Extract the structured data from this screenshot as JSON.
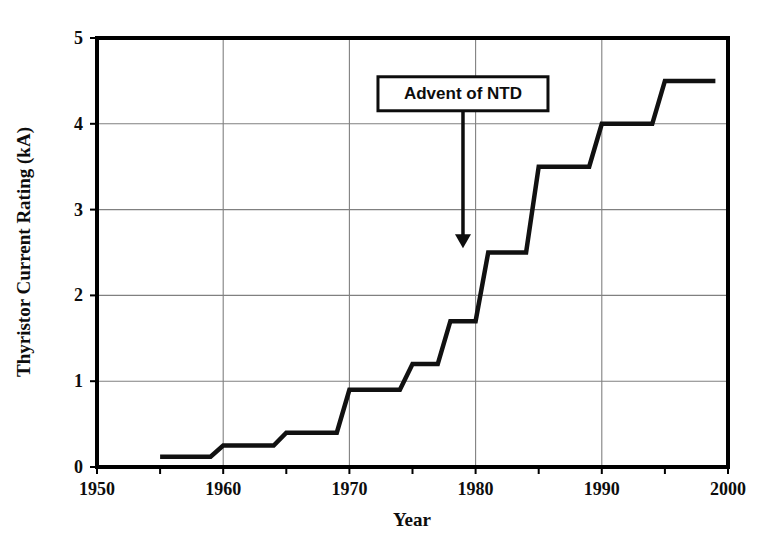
{
  "chart_data": {
    "type": "line",
    "title": "",
    "xlabel": "Year",
    "ylabel": "Thyristor Current Rating (kA)",
    "xlim": [
      1950,
      2000
    ],
    "ylim": [
      0,
      5
    ],
    "x_ticks": [
      1950,
      1960,
      1970,
      1980,
      1990,
      2000
    ],
    "x_tick_labels": [
      "1950",
      "1960",
      "1970",
      "1980",
      "1990",
      "2000"
    ],
    "x_minor_ticks": [
      1955,
      1965,
      1975,
      1985,
      1995
    ],
    "y_ticks": [
      0,
      1,
      2,
      3,
      4,
      5
    ],
    "y_tick_labels": [
      "0",
      "1",
      "2",
      "3",
      "4",
      "5"
    ],
    "grid": true,
    "grid_style": "solid thin gray, both axes at major ticks",
    "legend": null,
    "line_style": "step-post",
    "line_color": "#111111",
    "line_width": 4,
    "x": [
      1955,
      1959,
      1960,
      1964,
      1965,
      1969,
      1970,
      1974,
      1975,
      1977,
      1978,
      1980,
      1981,
      1984,
      1985,
      1989,
      1990,
      1994,
      1995,
      1999
    ],
    "y": [
      0.12,
      0.12,
      0.25,
      0.25,
      0.4,
      0.4,
      0.9,
      0.9,
      1.2,
      1.2,
      1.7,
      1.7,
      2.5,
      2.5,
      3.5,
      3.5,
      4.0,
      4.0,
      4.5,
      4.5
    ],
    "steps": [
      {
        "start_year": 1955,
        "end_year": 1959,
        "value": 0.12
      },
      {
        "start_year": 1960,
        "end_year": 1964,
        "value": 0.25
      },
      {
        "start_year": 1965,
        "end_year": 1969,
        "value": 0.4
      },
      {
        "start_year": 1970,
        "end_year": 1974,
        "value": 0.9
      },
      {
        "start_year": 1975,
        "end_year": 1977,
        "value": 1.2
      },
      {
        "start_year": 1978,
        "end_year": 1980,
        "value": 1.7
      },
      {
        "start_year": 1981,
        "end_year": 1984,
        "value": 2.5
      },
      {
        "start_year": 1985,
        "end_year": 1989,
        "value": 3.5
      },
      {
        "start_year": 1990,
        "end_year": 1994,
        "value": 4.0
      },
      {
        "start_year": 1995,
        "end_year": 1999,
        "value": 4.5
      }
    ],
    "annotations": [
      {
        "text": "Advent of NTD",
        "box_x_year": 1979,
        "box_y_value": 4.35,
        "arrow_tip_year": 1979,
        "arrow_tip_value": 2.55,
        "style": "boxed label with downward arrow"
      }
    ]
  },
  "axes": {
    "y_title": "Thyristor Current Rating (kA)",
    "x_title": "Year"
  },
  "colors": {
    "line": "#111111",
    "frame": "#000000",
    "grid": "#808080",
    "text": "#0d0d0d",
    "background": "#ffffff"
  }
}
